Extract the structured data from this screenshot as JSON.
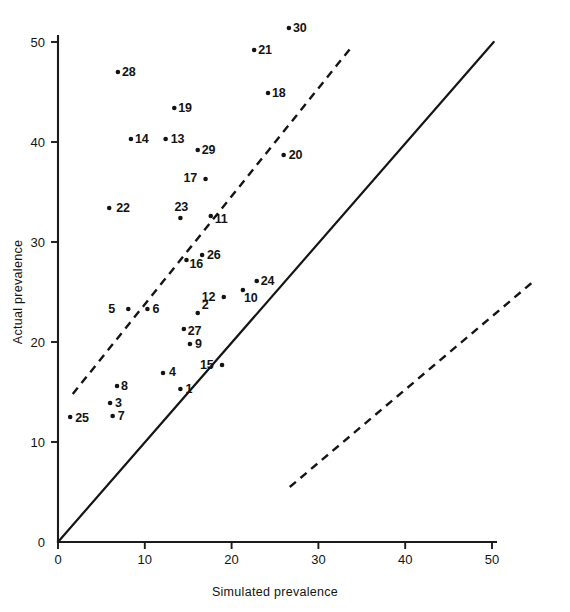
{
  "chart_data": {
    "type": "scatter",
    "title": "",
    "xlabel": "Simulated prevalence",
    "ylabel": "Actual prevalence",
    "xlim": [
      0,
      50
    ],
    "ylim": [
      0,
      50
    ],
    "xticks": [
      0,
      10,
      20,
      30,
      40,
      50
    ],
    "yticks": [
      0,
      10,
      20,
      30,
      40,
      50
    ],
    "xticklabels": [
      "0",
      "10",
      "20",
      "30",
      "40",
      "50"
    ],
    "yticklabels": [
      "0",
      "10",
      "20",
      "30",
      "40",
      "50"
    ],
    "grid": false,
    "legend": "none",
    "point_label_position": "adjacent-to-marker",
    "points": [
      {
        "label": "1",
        "x": 14.1,
        "y": 15.3
      },
      {
        "label": "2",
        "x": 16.1,
        "y": 22.9
      },
      {
        "label": "3",
        "x": 6.0,
        "y": 13.9
      },
      {
        "label": "4",
        "x": 12.1,
        "y": 16.9
      },
      {
        "label": "5",
        "x": 8.1,
        "y": 23.3
      },
      {
        "label": "6",
        "x": 10.3,
        "y": 23.3
      },
      {
        "label": "7",
        "x": 6.3,
        "y": 12.6
      },
      {
        "label": "8",
        "x": 6.8,
        "y": 15.6
      },
      {
        "label": "9",
        "x": 15.2,
        "y": 19.8
      },
      {
        "label": "10",
        "x": 21.3,
        "y": 25.2
      },
      {
        "label": "11",
        "x": 17.6,
        "y": 32.6
      },
      {
        "label": "12",
        "x": 19.1,
        "y": 24.5
      },
      {
        "label": "13",
        "x": 12.4,
        "y": 40.3
      },
      {
        "label": "14",
        "x": 8.4,
        "y": 40.3
      },
      {
        "label": "15",
        "x": 18.9,
        "y": 17.7
      },
      {
        "label": "16",
        "x": 14.8,
        "y": 28.2
      },
      {
        "label": "17",
        "x": 17.0,
        "y": 36.3
      },
      {
        "label": "18",
        "x": 24.2,
        "y": 44.9
      },
      {
        "label": "19",
        "x": 13.4,
        "y": 43.4
      },
      {
        "label": "20",
        "x": 26.0,
        "y": 38.7
      },
      {
        "label": "21",
        "x": 22.6,
        "y": 49.2
      },
      {
        "label": "22",
        "x": 5.9,
        "y": 33.4
      },
      {
        "label": "23",
        "x": 14.1,
        "y": 32.4
      },
      {
        "label": "24",
        "x": 22.9,
        "y": 26.1
      },
      {
        "label": "25",
        "x": 1.4,
        "y": 12.5
      },
      {
        "label": "26",
        "x": 16.6,
        "y": 28.7
      },
      {
        "label": "27",
        "x": 14.5,
        "y": 21.3
      },
      {
        "label": "28",
        "x": 6.9,
        "y": 47.0
      },
      {
        "label": "29",
        "x": 16.1,
        "y": 39.2
      },
      {
        "label": "30",
        "x": 26.6,
        "y": 51.4
      }
    ],
    "lines": [
      {
        "name": "identity-line",
        "style": "solid",
        "points": [
          [
            0,
            0
          ],
          [
            50.2,
            50.0
          ]
        ]
      },
      {
        "name": "upper-dashed-line",
        "style": "dashed",
        "points": [
          [
            1.7,
            14.8
          ],
          [
            34.0,
            49.7
          ]
        ]
      },
      {
        "name": "lower-dashed-line",
        "style": "dashed",
        "points": [
          [
            26.7,
            5.5
          ],
          [
            54.7,
            26.0
          ]
        ]
      }
    ]
  }
}
